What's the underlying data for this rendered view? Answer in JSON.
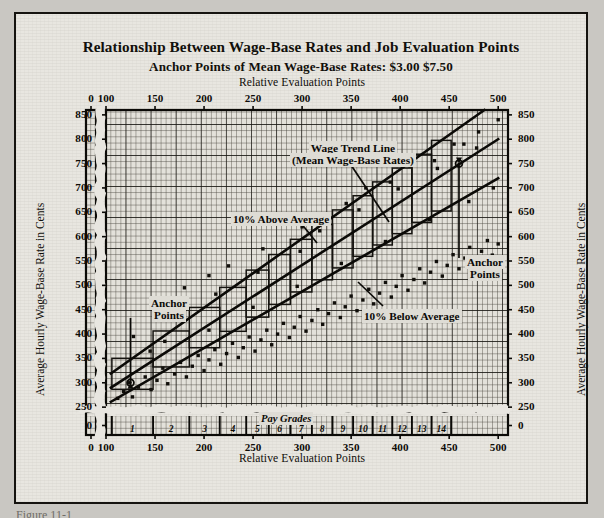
{
  "figure": {
    "title": "Relationship Between Wage-Base Rates and Job Evaluation Points",
    "subtitle": "Anchor Points of Mean Wage-Base Rates:  $3.00  $7.50",
    "caption_fragment": "Figure 11-1"
  },
  "chart_data": {
    "type": "scatter",
    "title": "Relationship Between Wage-Base Rates and Job Evaluation Points",
    "subtitle": "Anchor Points of Mean Wage-Base Rates:  $3.00  $7.50",
    "xlabel": "Relative Evaluation Points",
    "ylabel": "Average Hourly Wage-Base Rate in Cents",
    "xlabel_top": "Relative Evaluation Points",
    "ylabel_right": "Average Hourly Wage-Base Rate in Cents",
    "grid": true,
    "axis_break_x": true,
    "axis_break_y": true,
    "xlim": [
      0,
      510
    ],
    "ylim": [
      0,
      860
    ],
    "xticks": [
      0,
      100,
      150,
      200,
      250,
      300,
      350,
      400,
      450,
      500
    ],
    "yticks": [
      0,
      250,
      300,
      350,
      400,
      450,
      500,
      550,
      600,
      650,
      700,
      750,
      800,
      850
    ],
    "xtick_labels": [
      "0",
      "100",
      "150",
      "200",
      "250",
      "300",
      "350",
      "400",
      "450",
      "500"
    ],
    "ytick_labels": [
      "0",
      "250",
      "300",
      "350",
      "400",
      "450",
      "500",
      "550",
      "600",
      "650",
      "700",
      "750",
      "800",
      "850"
    ],
    "legend_position": "none",
    "series": [
      {
        "name": "Wage Trend Line (Mean Wage-Base Rates)",
        "type": "line",
        "x": [
          105,
          500
        ],
        "values": [
          290,
          800
        ],
        "style": "solid-thick"
      },
      {
        "name": "10% Above Average",
        "type": "line",
        "x": [
          105,
          500
        ],
        "values": [
          319,
          880
        ],
        "style": "solid-thick"
      },
      {
        "name": "10% Below Average",
        "type": "line",
        "x": [
          105,
          500
        ],
        "values": [
          261,
          720
        ],
        "style": "solid-thick"
      },
      {
        "name": "Job wage-base rate observations",
        "type": "scatter",
        "points": [
          [
            112,
            268
          ],
          [
            118,
            282
          ],
          [
            124,
            300
          ],
          [
            127,
            271
          ],
          [
            133,
            291
          ],
          [
            140,
            312
          ],
          [
            146,
            286
          ],
          [
            152,
            305
          ],
          [
            158,
            330
          ],
          [
            163,
            298
          ],
          [
            170,
            318
          ],
          [
            176,
            342
          ],
          [
            182,
            312
          ],
          [
            188,
            334
          ],
          [
            194,
            356
          ],
          [
            200,
            325
          ],
          [
            205,
            347
          ],
          [
            211,
            368
          ],
          [
            217,
            338
          ],
          [
            223,
            360
          ],
          [
            229,
            381
          ],
          [
            235,
            352
          ],
          [
            240,
            372
          ],
          [
            246,
            394
          ],
          [
            252,
            365
          ],
          [
            258,
            388
          ],
          [
            264,
            408
          ],
          [
            269,
            378
          ],
          [
            275,
            400
          ],
          [
            281,
            422
          ],
          [
            287,
            393
          ],
          [
            292,
            414
          ],
          [
            298,
            436
          ],
          [
            304,
            406
          ],
          [
            310,
            428
          ],
          [
            316,
            450
          ],
          [
            321,
            420
          ],
          [
            327,
            442
          ],
          [
            333,
            464
          ],
          [
            339,
            434
          ],
          [
            344,
            456
          ],
          [
            350,
            478
          ],
          [
            356,
            448
          ],
          [
            362,
            470
          ],
          [
            368,
            492
          ],
          [
            373,
            462
          ],
          [
            379,
            484
          ],
          [
            385,
            506
          ],
          [
            391,
            476
          ],
          [
            396,
            498
          ],
          [
            402,
            520
          ],
          [
            408,
            490
          ],
          [
            414,
            512
          ],
          [
            420,
            534
          ],
          [
            425,
            505
          ],
          [
            431,
            527
          ],
          [
            437,
            549
          ],
          [
            443,
            519
          ],
          [
            448,
            541
          ],
          [
            454,
            563
          ],
          [
            460,
            534
          ],
          [
            466,
            556
          ],
          [
            471,
            578
          ],
          [
            477,
            548
          ],
          [
            483,
            570
          ],
          [
            489,
            592
          ],
          [
            494,
            562
          ],
          [
            500,
            585
          ],
          [
            145,
            365
          ],
          [
            160,
            385
          ],
          [
            205,
            408
          ],
          [
            250,
            455
          ],
          [
            295,
            498
          ],
          [
            340,
            545
          ],
          [
            385,
            590
          ],
          [
            430,
            635
          ],
          [
            470,
            672
          ],
          [
            495,
            700
          ],
          [
            300,
            620
          ],
          [
            345,
            668
          ],
          [
            390,
            712
          ],
          [
            435,
            756
          ],
          [
            465,
            790
          ],
          [
            225,
            540
          ],
          [
            260,
            575
          ],
          [
            180,
            495
          ],
          [
            205,
            520
          ],
          [
            150,
            440
          ],
          [
            365,
            700
          ],
          [
            410,
            745
          ],
          [
            455,
            790
          ],
          [
            480,
            815
          ],
          [
            500,
            840
          ],
          [
            128,
            395
          ],
          [
            168,
            440
          ],
          [
            212,
            482
          ],
          [
            255,
            527
          ],
          [
            298,
            570
          ],
          [
            318,
            612
          ],
          [
            358,
            655
          ],
          [
            398,
            698
          ],
          [
            438,
            740
          ],
          [
            478,
            782
          ]
        ]
      }
    ],
    "annotations": [
      {
        "name": "trend-line-label",
        "text_line1": "Wage Trend Line",
        "text_line2": "(Mean Wage-Base Rates)",
        "x": 330,
        "y": 745
      },
      {
        "name": "above-average-label",
        "text": "10% Above Average",
        "x": 268,
        "y": 608
      },
      {
        "name": "below-average-label",
        "text": "10% Below Average",
        "x": 400,
        "y": 455
      },
      {
        "name": "anchor-points-left-label",
        "text_line1": "Anchor",
        "text_line2": "Points",
        "x": 165,
        "y": 490
      },
      {
        "name": "anchor-points-right-label",
        "text_line1": "Anchor",
        "text_line2": "Points",
        "x": 470,
        "y": 560
      },
      {
        "name": "pay-grades-label",
        "text": "Pay Grades"
      }
    ],
    "anchor_points": [
      {
        "label": "$3.00",
        "x": 125,
        "y": 300
      },
      {
        "label": "$7.50",
        "x": 460,
        "y": 750
      }
    ],
    "pay_grades": {
      "label": "Pay Grades",
      "labels": [
        "1",
        "2",
        "3",
        "4",
        "5",
        "6",
        "7",
        "8",
        "9",
        "10",
        "11",
        "12",
        "13",
        "14"
      ],
      "boundaries": [
        106,
        148,
        185,
        216,
        243,
        266,
        288,
        310,
        331,
        352,
        372,
        392,
        412,
        432,
        452
      ]
    }
  }
}
